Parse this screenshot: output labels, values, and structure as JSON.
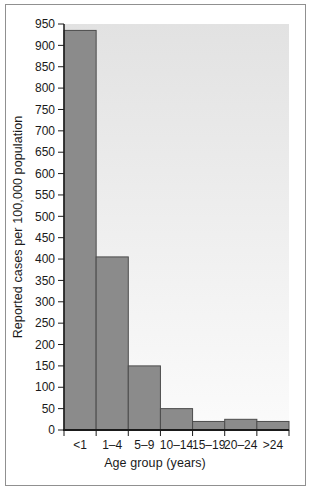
{
  "figure": {
    "frame_color": "#909090",
    "background_color": "#ffffff"
  },
  "chart_data": {
    "type": "bar",
    "categories": [
      "<1",
      "1–4",
      "5–9",
      "10–14",
      "15–19",
      "20–24",
      ">24"
    ],
    "values": [
      935,
      405,
      150,
      50,
      20,
      25,
      20
    ],
    "xlabel": "Age group (years)",
    "ylabel": "Reported cases per 100,000 population",
    "ylim": [
      0,
      950
    ],
    "yticks": [
      0,
      50,
      100,
      150,
      200,
      250,
      300,
      350,
      400,
      450,
      500,
      550,
      600,
      650,
      700,
      750,
      800,
      850,
      900,
      950
    ],
    "grid": false,
    "legend_position": "none",
    "bars_adjacent": true,
    "colors": {
      "bar_fill": "#8b8b8b",
      "bar_stroke": "#4c4c4c",
      "plot_bg_top": "#e2e2e2",
      "plot_bg_bottom": "#fbfbfb",
      "axis": "#1a1a1a",
      "text": "#1a1a1a"
    }
  }
}
